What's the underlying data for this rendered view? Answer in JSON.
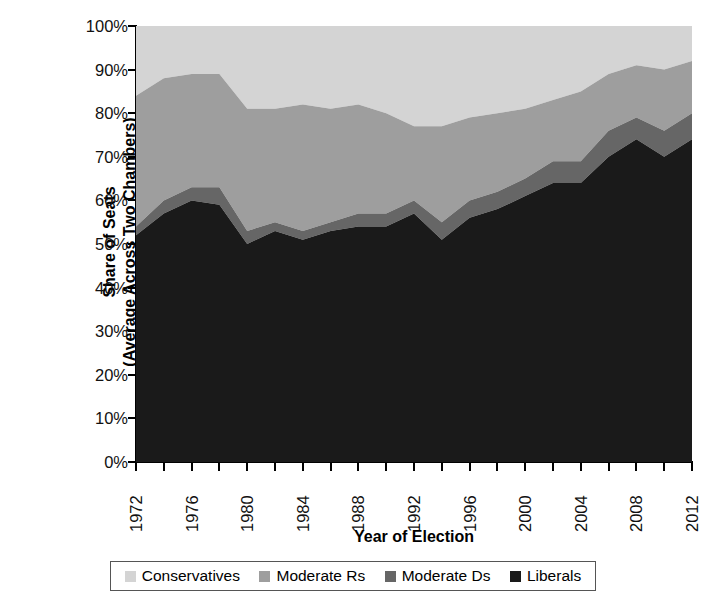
{
  "chart_data": {
    "type": "area",
    "title": "",
    "xlabel": "Year of Election",
    "ylabel_lines": [
      "Share of Seats",
      "(Average Across Two Chambers)"
    ],
    "ylabel": "Share of Seats (Average Across Two Chambers)",
    "stacked": true,
    "stack_order_bottom_to_top": [
      "Liberals",
      "Moderate Ds",
      "Moderate Rs",
      "Conservatives"
    ],
    "grid": false,
    "legend_position": "bottom",
    "ylim": [
      0,
      100
    ],
    "y_unit": "%",
    "yticks": [
      0,
      10,
      20,
      30,
      40,
      50,
      60,
      70,
      80,
      90,
      100
    ],
    "ytick_labels": [
      "0%",
      "10%",
      "20%",
      "30%",
      "40%",
      "50%",
      "60%",
      "70%",
      "80%",
      "90%",
      "100%"
    ],
    "xlim": [
      1972,
      2012
    ],
    "xticks": [
      1972,
      1974,
      1976,
      1978,
      1980,
      1982,
      1984,
      1986,
      1988,
      1990,
      1992,
      1994,
      1996,
      1998,
      2000,
      2002,
      2004,
      2006,
      2008,
      2010,
      2012
    ],
    "xtick_labels": [
      "1972",
      "",
      "1976",
      "",
      "1980",
      "",
      "1984",
      "",
      "1988",
      "",
      "1992",
      "",
      "1996",
      "",
      "2000",
      "",
      "2004",
      "",
      "2008",
      "",
      "2012"
    ],
    "xtick_labels_shown": [
      "1972",
      "1976",
      "1980",
      "1984",
      "1988",
      "1992",
      "1996",
      "2000",
      "2004",
      "2008",
      "2012"
    ],
    "x": [
      1972,
      1974,
      1976,
      1978,
      1980,
      1982,
      1984,
      1986,
      1988,
      1990,
      1992,
      1994,
      1996,
      1998,
      2000,
      2002,
      2004,
      2006,
      2008,
      2010,
      2012
    ],
    "series": [
      {
        "name": "Liberals",
        "color": "#1a1a1a",
        "values": [
          52,
          57,
          60,
          59,
          50,
          53,
          51,
          53,
          54,
          54,
          57,
          51,
          56,
          58,
          61,
          64,
          64,
          70,
          74,
          70,
          74
        ]
      },
      {
        "name": "Moderate Ds",
        "color": "#666666",
        "values": [
          2,
          3,
          3,
          4,
          3,
          2,
          2,
          2,
          3,
          3,
          3,
          4,
          4,
          4,
          4,
          5,
          5,
          6,
          5,
          6,
          6
        ]
      },
      {
        "name": "Moderate Rs",
        "color": "#9e9e9e",
        "values": [
          30,
          28,
          26,
          26,
          28,
          26,
          29,
          26,
          25,
          23,
          17,
          22,
          19,
          18,
          16,
          14,
          16,
          13,
          12,
          14,
          12
        ]
      },
      {
        "name": "Conservatives",
        "color": "#d4d4d4",
        "values": [
          16,
          12,
          11,
          11,
          19,
          19,
          18,
          19,
          18,
          20,
          23,
          23,
          21,
          20,
          19,
          17,
          15,
          11,
          9,
          10,
          8
        ]
      }
    ],
    "cumulative_tops": {
      "liberals_top": [
        52,
        57,
        60,
        59,
        50,
        53,
        51,
        53,
        54,
        54,
        57,
        51,
        56,
        58,
        61,
        64,
        64,
        70,
        74,
        70,
        74
      ],
      "moderate_ds_top": [
        54,
        60,
        63,
        63,
        53,
        55,
        53,
        55,
        57,
        57,
        60,
        55,
        60,
        62,
        65,
        69,
        69,
        76,
        79,
        76,
        80
      ],
      "moderate_rs_top": [
        84,
        88,
        89,
        89,
        81,
        81,
        82,
        81,
        82,
        80,
        77,
        77,
        79,
        80,
        81,
        83,
        85,
        89,
        91,
        90,
        92
      ],
      "conservatives_top": [
        100,
        100,
        100,
        100,
        100,
        100,
        100,
        100,
        100,
        100,
        100,
        100,
        100,
        100,
        100,
        100,
        100,
        100,
        100,
        100,
        100
      ]
    }
  },
  "legend": {
    "items": [
      {
        "label": "Conservatives",
        "color": "#d4d4d4"
      },
      {
        "label": "Moderate Rs",
        "color": "#9e9e9e"
      },
      {
        "label": "Moderate Ds",
        "color": "#666666"
      },
      {
        "label": "Liberals",
        "color": "#1a1a1a"
      }
    ]
  },
  "axes": {
    "x_title": "Year of Election",
    "y_title_line1": "Share of Seats",
    "y_title_line2": "(Average Across Two Chambers)"
  }
}
